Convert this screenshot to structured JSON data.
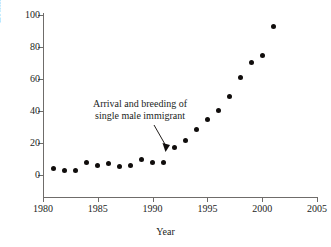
{
  "chart_data": {
    "type": "scatter",
    "title": "",
    "xlabel": "Year",
    "ylabel": "Estimated population size",
    "xlim": [
      1980,
      2005
    ],
    "ylim": [
      0,
      100
    ],
    "grid": false,
    "legend": "none",
    "x_ticks": [
      "1980",
      "1985",
      "1990",
      "1995",
      "2000",
      "2005"
    ],
    "x_tick_values": [
      1980,
      1985,
      1990,
      1995,
      2000,
      2005
    ],
    "y_ticks": [
      "0",
      "20",
      "40",
      "60",
      "80",
      "100"
    ],
    "y_tick_values": [
      0,
      20,
      40,
      60,
      80,
      100
    ],
    "x": [
      1981,
      1982,
      1983,
      1984,
      1985,
      1986,
      1987,
      1988,
      1989,
      1990,
      1991,
      1992,
      1993,
      1994,
      1995,
      1996,
      1997,
      1998,
      1999,
      2000,
      2001
    ],
    "values": [
      4,
      3,
      3,
      8,
      6,
      7,
      5.5,
      6,
      10,
      8,
      8,
      17.5,
      21.5,
      28.5,
      34.5,
      40.5,
      49,
      61,
      70.5,
      74.5,
      93
    ],
    "marker": "filled-circle",
    "marker_color": "#100d0c",
    "annotations": [
      {
        "text_lines": [
          "Arrival and breeding of",
          "single male immigrant"
        ],
        "points_to_x": 1991.3,
        "points_to_y": 15
      }
    ]
  }
}
